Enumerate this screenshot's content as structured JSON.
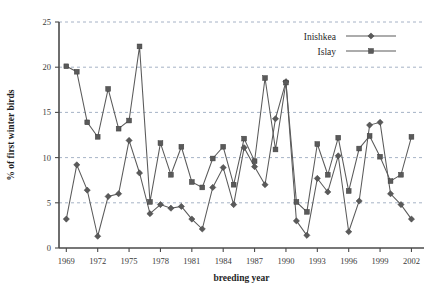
{
  "chart_data": {
    "type": "line",
    "title": "",
    "xlabel": "breeding year",
    "ylabel": "% of first winter birds",
    "xlim": [
      1968.3,
      2003.2
    ],
    "ylim": [
      0,
      25
    ],
    "yticks": [
      0,
      5,
      10,
      15,
      20,
      25
    ],
    "xticks": [
      1969,
      1972,
      1975,
      1978,
      1981,
      1984,
      1987,
      1990,
      1993,
      1996,
      1999,
      2002
    ],
    "xtick_labels": [
      "1969",
      "1972",
      "1975",
      "1978",
      "1981",
      "1984",
      "1987",
      "1990",
      "1993",
      "1996",
      "1999",
      "2002"
    ],
    "ytick_labels": [
      "0",
      "5",
      "10",
      "15",
      "20",
      "25"
    ],
    "grid": "horizontal-dashed",
    "legend_position": "top-right",
    "x": [
      1969,
      1970,
      1971,
      1972,
      1973,
      1974,
      1975,
      1976,
      1977,
      1978,
      1979,
      1980,
      1981,
      1982,
      1983,
      1984,
      1985,
      1986,
      1987,
      1988,
      1989,
      1990,
      1991,
      1992,
      1993,
      1994,
      1995,
      1996,
      1997,
      1998,
      1999,
      2000,
      2001,
      2002
    ],
    "series": [
      {
        "name": "Inishkea",
        "marker": "diamond",
        "color": "#5a5a5a",
        "values": [
          3.2,
          9.2,
          6.4,
          1.3,
          5.7,
          6.0,
          11.9,
          8.3,
          3.8,
          4.8,
          4.4,
          4.6,
          3.2,
          2.1,
          6.7,
          8.9,
          4.8,
          11.1,
          9.0,
          7.0,
          14.3,
          18.4,
          3.0,
          1.4,
          7.7,
          6.2,
          10.2,
          1.8,
          5.2,
          13.6,
          13.9,
          6.0,
          4.8,
          3.2
        ]
      },
      {
        "name": "Islay",
        "marker": "square",
        "color": "#5a5a5a",
        "values": [
          20.1,
          19.5,
          13.9,
          12.3,
          17.6,
          13.2,
          14.1,
          22.3,
          5.1,
          11.6,
          8.1,
          11.2,
          7.3,
          6.7,
          9.9,
          11.2,
          7.0,
          12.1,
          9.6,
          18.8,
          10.9,
          18.3,
          5.1,
          4.0,
          11.5,
          8.1,
          12.2,
          6.3,
          11.0,
          12.4,
          10.1,
          7.4,
          8.1,
          12.3
        ]
      }
    ]
  },
  "legend": {
    "entries": [
      {
        "label": "Inishkea"
      },
      {
        "label": "Islay"
      }
    ]
  }
}
